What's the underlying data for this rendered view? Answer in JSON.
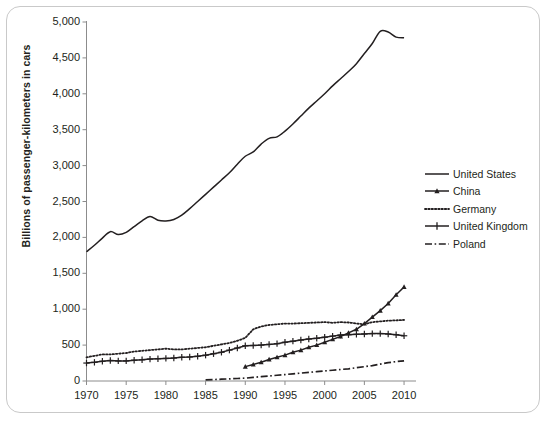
{
  "chart": {
    "ylabel": "Billions of passenger-kilometers in cars",
    "xlabel": ""
  },
  "legend": {
    "items": [
      {
        "label": "United States",
        "style": "solid"
      },
      {
        "label": "China",
        "style": "solid-triangle"
      },
      {
        "label": "Germany",
        "style": "dotted"
      },
      {
        "label": "United Kingdom",
        "style": "solid-plus"
      },
      {
        "label": "Poland",
        "style": "dashdot"
      }
    ]
  },
  "axes": {
    "y_ticks": [
      "5,000",
      "4,500",
      "4,000",
      "3,500",
      "3,000",
      "2,500",
      "2,000",
      "1,500",
      "1,000",
      "500",
      "0"
    ],
    "x_ticks": [
      "1970",
      "1975",
      "1980",
      "1985",
      "1990",
      "1995",
      "2000",
      "2005",
      "2010"
    ]
  },
  "chart_data": {
    "type": "line",
    "title": "",
    "xlabel": "",
    "ylabel": "Billions of passenger-kilometers in cars",
    "xlim": [
      1970,
      2011
    ],
    "ylim": [
      0,
      5000
    ],
    "ytick_step": 500,
    "xtick_step": 5,
    "grid": false,
    "legend_position": "right",
    "series": [
      {
        "name": "United States",
        "style": "solid",
        "marker": "none",
        "color": "#231f20",
        "x": [
          1970,
          1971,
          1972,
          1973,
          1974,
          1975,
          1976,
          1977,
          1978,
          1979,
          1980,
          1981,
          1982,
          1983,
          1984,
          1985,
          1986,
          1987,
          1988,
          1989,
          1990,
          1991,
          1992,
          1993,
          1994,
          1995,
          1996,
          1997,
          1998,
          1999,
          2000,
          2001,
          2002,
          2003,
          2004,
          2005,
          2006,
          2007,
          2008,
          2009,
          2010
        ],
        "y": [
          1800,
          1890,
          1990,
          2080,
          2040,
          2070,
          2150,
          2230,
          2290,
          2240,
          2230,
          2250,
          2310,
          2400,
          2500,
          2600,
          2700,
          2800,
          2900,
          3020,
          3130,
          3190,
          3300,
          3380,
          3400,
          3480,
          3580,
          3690,
          3800,
          3900,
          4000,
          4110,
          4210,
          4310,
          4420,
          4560,
          4700,
          4870,
          4860,
          4790,
          4780
        ]
      },
      {
        "name": "China",
        "style": "solid",
        "marker": "triangle",
        "color": "#231f20",
        "x": [
          1990,
          1991,
          1992,
          1993,
          1994,
          1995,
          1996,
          1997,
          1998,
          1999,
          2000,
          2001,
          2002,
          2003,
          2004,
          2005,
          2006,
          2007,
          2008,
          2009,
          2010
        ],
        "y": [
          200,
          230,
          260,
          300,
          330,
          360,
          400,
          430,
          470,
          500,
          540,
          580,
          620,
          670,
          720,
          800,
          890,
          980,
          1080,
          1200,
          1310
        ]
      },
      {
        "name": "Germany",
        "style": "dotted",
        "marker": "none",
        "color": "#231f20",
        "x": [
          1970,
          1971,
          1972,
          1973,
          1974,
          1975,
          1976,
          1977,
          1978,
          1979,
          1980,
          1981,
          1982,
          1983,
          1984,
          1985,
          1986,
          1987,
          1988,
          1989,
          1990,
          1991,
          1992,
          1993,
          1994,
          1995,
          1996,
          1997,
          1998,
          1999,
          2000,
          2001,
          2002,
          2003,
          2004,
          2005,
          2006,
          2007,
          2008,
          2009,
          2010
        ],
        "y": [
          330,
          350,
          370,
          370,
          380,
          390,
          410,
          420,
          430,
          440,
          450,
          440,
          440,
          450,
          460,
          470,
          490,
          510,
          530,
          560,
          600,
          720,
          760,
          780,
          790,
          800,
          800,
          805,
          810,
          815,
          820,
          810,
          820,
          815,
          800,
          790,
          820,
          830,
          840,
          845,
          850
        ]
      },
      {
        "name": "United Kingdom",
        "style": "solid",
        "marker": "plus",
        "color": "#231f20",
        "x": [
          1970,
          1971,
          1972,
          1973,
          1974,
          1975,
          1976,
          1977,
          1978,
          1979,
          1980,
          1981,
          1982,
          1983,
          1984,
          1985,
          1986,
          1987,
          1988,
          1989,
          1990,
          1991,
          1992,
          1993,
          1994,
          1995,
          1996,
          1997,
          1998,
          1999,
          2000,
          2001,
          2002,
          2003,
          2004,
          2005,
          2006,
          2007,
          2008,
          2009,
          2010
        ],
        "y": [
          250,
          260,
          275,
          285,
          280,
          280,
          290,
          295,
          305,
          310,
          315,
          320,
          330,
          335,
          345,
          360,
          380,
          400,
          430,
          460,
          490,
          495,
          500,
          510,
          520,
          540,
          555,
          570,
          585,
          595,
          610,
          625,
          640,
          645,
          650,
          655,
          660,
          660,
          655,
          645,
          630
        ]
      },
      {
        "name": "Poland",
        "style": "dashdot",
        "marker": "none",
        "color": "#231f20",
        "x": [
          1985,
          1986,
          1987,
          1988,
          1989,
          1990,
          1991,
          1992,
          1993,
          1994,
          1995,
          1996,
          1997,
          1998,
          1999,
          2000,
          2001,
          2002,
          2003,
          2004,
          2005,
          2006,
          2007,
          2008,
          2009,
          2010
        ],
        "y": [
          15,
          20,
          25,
          30,
          35,
          40,
          50,
          60,
          70,
          80,
          90,
          100,
          110,
          120,
          130,
          140,
          150,
          160,
          170,
          185,
          200,
          215,
          235,
          255,
          270,
          280
        ]
      }
    ]
  }
}
